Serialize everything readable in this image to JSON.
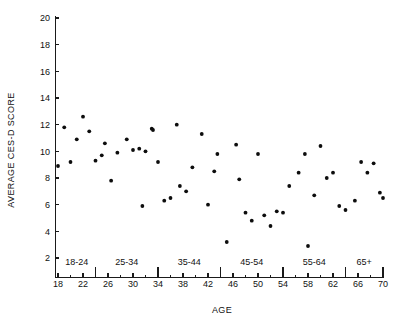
{
  "figure": {
    "background_color": "#ffffff",
    "point_color": "#0d0d0d",
    "axis_color": "#1a1a1a"
  },
  "chart_data": {
    "type": "scatter",
    "title": "",
    "xlabel": "AGE",
    "ylabel": "AVERAGE CES-D SCORE",
    "xlim": [
      18,
      70
    ],
    "ylim": [
      2,
      20
    ],
    "grid": false,
    "legend": false,
    "x_ticks": [
      18,
      22,
      26,
      30,
      34,
      38,
      42,
      46,
      50,
      54,
      58,
      62,
      66,
      70
    ],
    "x_tick_labels": [
      "18",
      "22",
      "26",
      "30",
      "34",
      "38",
      "42",
      "46",
      "50",
      "54",
      "58",
      "62",
      "66",
      "70"
    ],
    "x_minor_ticks": [
      20,
      24,
      28,
      32,
      36,
      40,
      44,
      48,
      52,
      56,
      60,
      64,
      68
    ],
    "y_ticks": [
      2,
      4,
      6,
      8,
      10,
      12,
      14,
      16,
      18,
      20
    ],
    "y_tick_labels": [
      "2",
      "4",
      "6",
      "8",
      "10",
      "12",
      "14",
      "16",
      "18",
      "20"
    ],
    "group_separators": [
      24,
      34,
      44,
      54,
      64,
      70
    ],
    "age_groups": [
      {
        "label": "18-24",
        "start": 18,
        "end": 24,
        "center": 21
      },
      {
        "label": "25-34",
        "start": 24,
        "end": 34,
        "center": 29
      },
      {
        "label": "35-44",
        "start": 34,
        "end": 44,
        "center": 39
      },
      {
        "label": "45-54",
        "start": 44,
        "end": 54,
        "center": 49
      },
      {
        "label": "55-64",
        "start": 54,
        "end": 64,
        "center": 59
      },
      {
        "label": "65+",
        "start": 64,
        "end": 70,
        "center": 67
      }
    ],
    "x": [
      18,
      19,
      20,
      21,
      22,
      23,
      24,
      25,
      25.5,
      26.5,
      27.5,
      29,
      30,
      31,
      31.5,
      32,
      33,
      33,
      34,
      35,
      36,
      37,
      37.5,
      38.5,
      39.5,
      41,
      42,
      43,
      43.5,
      45,
      46.5,
      47,
      48,
      49,
      50,
      51,
      52,
      53,
      54,
      55,
      56.5,
      57.5,
      58,
      59,
      60,
      61,
      62,
      63,
      64,
      65.5,
      66.5,
      67.5,
      68.5,
      69.5
    ],
    "y": [
      8.9,
      11.8,
      9.2,
      10.9,
      12.6,
      11.5,
      9.3,
      9.7,
      10.6,
      7.8,
      9.9,
      10.9,
      10.1,
      10.2,
      5.9,
      10.0,
      11.7,
      11.6,
      9.2,
      6.3,
      6.5,
      12.0,
      7.4,
      7.0,
      8.8,
      11.3,
      6.0,
      8.5,
      9.8,
      3.2,
      10.5,
      7.9,
      5.4,
      4.8,
      9.8,
      5.2,
      4.4,
      5.5,
      5.4,
      7.4,
      8.4,
      9.8,
      2.9,
      6.7,
      10.4,
      8.0,
      8.4,
      5.9,
      5.6,
      6.3,
      9.2,
      8.4,
      9.1,
      6.9
    ],
    "n_points": 54,
    "points": [
      {
        "age": 18,
        "score": 8.9
      },
      {
        "age": 19,
        "score": 11.8
      },
      {
        "age": 20,
        "score": 9.2
      },
      {
        "age": 21,
        "score": 10.9
      },
      {
        "age": 22,
        "score": 12.6
      },
      {
        "age": 23,
        "score": 11.5
      },
      {
        "age": 24,
        "score": 9.3
      },
      {
        "age": 25,
        "score": 9.7
      },
      {
        "age": 25.5,
        "score": 10.6
      },
      {
        "age": 26.5,
        "score": 7.8
      },
      {
        "age": 27.5,
        "score": 9.9
      },
      {
        "age": 29,
        "score": 10.9
      },
      {
        "age": 30,
        "score": 10.1
      },
      {
        "age": 31,
        "score": 10.2
      },
      {
        "age": 31.5,
        "score": 5.9
      },
      {
        "age": 32,
        "score": 10.0
      },
      {
        "age": 33,
        "score": 11.7
      },
      {
        "age": 33.2,
        "score": 11.6
      },
      {
        "age": 34,
        "score": 9.2
      },
      {
        "age": 35,
        "score": 6.3
      },
      {
        "age": 36,
        "score": 6.5
      },
      {
        "age": 37,
        "score": 12.0
      },
      {
        "age": 37.5,
        "score": 7.4
      },
      {
        "age": 38.5,
        "score": 7.0
      },
      {
        "age": 39.5,
        "score": 8.8
      },
      {
        "age": 41,
        "score": 11.3
      },
      {
        "age": 42,
        "score": 6.0
      },
      {
        "age": 43,
        "score": 8.5
      },
      {
        "age": 43.5,
        "score": 9.8
      },
      {
        "age": 45,
        "score": 3.2
      },
      {
        "age": 46.5,
        "score": 10.5
      },
      {
        "age": 47,
        "score": 7.9
      },
      {
        "age": 48,
        "score": 5.4
      },
      {
        "age": 49,
        "score": 4.8
      },
      {
        "age": 50,
        "score": 9.8
      },
      {
        "age": 51,
        "score": 5.2
      },
      {
        "age": 52,
        "score": 4.4
      },
      {
        "age": 53,
        "score": 5.5
      },
      {
        "age": 54,
        "score": 5.4
      },
      {
        "age": 55,
        "score": 7.4
      },
      {
        "age": 56.5,
        "score": 8.4
      },
      {
        "age": 57.5,
        "score": 9.8
      },
      {
        "age": 58,
        "score": 2.9
      },
      {
        "age": 59,
        "score": 6.7
      },
      {
        "age": 60,
        "score": 10.4
      },
      {
        "age": 61,
        "score": 8.0
      },
      {
        "age": 62,
        "score": 8.4
      },
      {
        "age": 63,
        "score": 5.9
      },
      {
        "age": 64,
        "score": 5.6
      },
      {
        "age": 65.5,
        "score": 6.3
      },
      {
        "age": 66.5,
        "score": 9.2
      },
      {
        "age": 67.5,
        "score": 8.4
      },
      {
        "age": 68.5,
        "score": 9.1
      },
      {
        "age": 69.5,
        "score": 6.9
      },
      {
        "age": 70,
        "score": 6.5
      }
    ]
  }
}
